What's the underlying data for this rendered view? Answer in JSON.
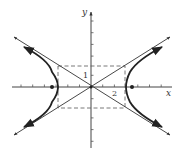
{
  "figure": {
    "type": "hyperbola-graph",
    "x_axis_label": "x",
    "y_axis_label": "y",
    "tick_labels": {
      "x": "2",
      "y": "1"
    },
    "origin_px": [
      91,
      87
    ],
    "unit_px": 11.7,
    "a": 3,
    "b": 1.8,
    "foci_x": [
      -3.5,
      3.5
    ],
    "colors": {
      "curve": "#222222",
      "axes": "#444444",
      "asymptotes": "#333333",
      "dashed_box": "#555555"
    }
  }
}
